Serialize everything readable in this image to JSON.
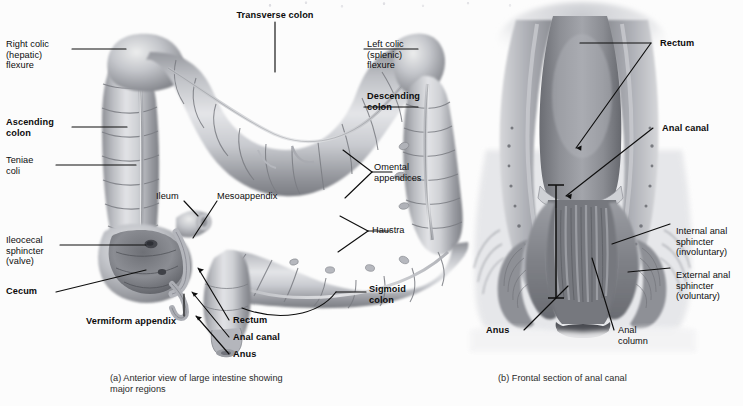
{
  "figure": {
    "background_color": "#fcfcfc",
    "ink_color": "#0d0d0d",
    "title_present": false
  },
  "panel_a": {
    "caption": "(a) Anterior view of large intestine showing\n     major regions",
    "labels": [
      {
        "id": "right-colic-flexure",
        "text": "Right colic\n(hepatic)\nflexure",
        "bold": false
      },
      {
        "id": "transverse-colon",
        "text": "Transverse colon",
        "bold": true
      },
      {
        "id": "left-colic-flexure",
        "text": "Left colic\n(splenic)\nflexure",
        "bold": false
      },
      {
        "id": "descending-colon",
        "text": "Descending\ncolon",
        "bold": true
      },
      {
        "id": "ascending-colon",
        "text": "Ascending\ncolon",
        "bold": true
      },
      {
        "id": "teniae-coli",
        "text": "Teniae\ncoli",
        "bold": false
      },
      {
        "id": "omental-appendices",
        "text": "Omental\nappendices",
        "bold": false
      },
      {
        "id": "ileum",
        "text": "Ileum",
        "bold": false
      },
      {
        "id": "mesoappendix",
        "text": "Mesoappendix",
        "bold": false
      },
      {
        "id": "haustra",
        "text": "Haustra",
        "bold": false
      },
      {
        "id": "ileocecal-sphincter",
        "text": "Ileocecal\nsphincter\n(valve)",
        "bold": false
      },
      {
        "id": "cecum",
        "text": "Cecum",
        "bold": true
      },
      {
        "id": "vermiform-appendix",
        "text": "Vermiform appendix",
        "bold": true
      },
      {
        "id": "sigmoid-colon",
        "text": "Sigmoid\ncolon",
        "bold": true
      },
      {
        "id": "rectum",
        "text": "Rectum",
        "bold": true
      },
      {
        "id": "anal-canal",
        "text": "Anal canal",
        "bold": true
      },
      {
        "id": "anus",
        "text": "Anus",
        "bold": true
      }
    ]
  },
  "panel_b": {
    "caption": "(b) Frontal section of anal canal",
    "labels": [
      {
        "id": "rectum",
        "text": "Rectum",
        "bold": true
      },
      {
        "id": "anal-canal",
        "text": "Anal canal",
        "bold": true
      },
      {
        "id": "internal-anal-sphincter",
        "text": "Internal anal\nsphincter\n(involuntary)",
        "bold": false
      },
      {
        "id": "external-anal-sphincter",
        "text": "External anal\nsphincter\n(voluntary)",
        "bold": false
      },
      {
        "id": "anus",
        "text": "Anus",
        "bold": true
      },
      {
        "id": "anal-column",
        "text": "Anal\ncolumn",
        "bold": false
      }
    ]
  }
}
